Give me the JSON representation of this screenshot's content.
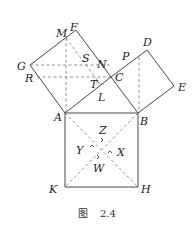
{
  "caption": {
    "figure_char": "图",
    "number": "2.4"
  },
  "points": {
    "A": {
      "label": "A",
      "x": 65,
      "y": 113
    },
    "B": {
      "label": "B",
      "x": 138,
      "y": 113
    },
    "C": {
      "label": "C",
      "x": 111,
      "y": 77
    },
    "D": {
      "label": "D",
      "x": 147,
      "y": 50
    },
    "E": {
      "label": "E",
      "x": 174,
      "y": 86
    },
    "F": {
      "label": "F",
      "x": 76,
      "y": 30
    },
    "G": {
      "label": "G",
      "x": 30,
      "y": 65
    },
    "H": {
      "label": "H",
      "x": 138,
      "y": 187
    },
    "K": {
      "label": "K",
      "x": 65,
      "y": 187
    },
    "M": {
      "label": "M",
      "x": 66,
      "y": 38
    },
    "N": {
      "label": "N",
      "x": 103,
      "y": 71
    },
    "P": {
      "label": "P",
      "x": 124,
      "y": 60
    },
    "R": {
      "label": "R",
      "x": 37,
      "y": 77
    },
    "S": {
      "label": "S",
      "x": 86,
      "y": 55
    },
    "T": {
      "label": "T",
      "x": 97,
      "y": 85
    },
    "L": {
      "label": "L",
      "x": 99,
      "y": 95
    },
    "Z": {
      "label": "Z",
      "x": 102,
      "y": 136
    },
    "Y": {
      "label": "Y",
      "x": 92,
      "y": 146
    },
    "X": {
      "label": "X",
      "x": 111,
      "y": 152
    },
    "W": {
      "label": "W",
      "x": 98,
      "y": 161
    }
  },
  "labels": [
    {
      "text": "M",
      "x": 56,
      "y": 37
    },
    {
      "text": "F",
      "x": 70,
      "y": 31
    },
    {
      "text": "S",
      "x": 82,
      "y": 62
    },
    {
      "text": "G",
      "x": 17,
      "y": 70
    },
    {
      "text": "R",
      "x": 25,
      "y": 82
    },
    {
      "text": "N",
      "x": 97,
      "y": 68
    },
    {
      "text": "P",
      "x": 122,
      "y": 60
    },
    {
      "text": "D",
      "x": 143,
      "y": 46
    },
    {
      "text": "C",
      "x": 115,
      "y": 81
    },
    {
      "text": "T",
      "x": 90,
      "y": 88
    },
    {
      "text": "L",
      "x": 98,
      "y": 101
    },
    {
      "text": "E",
      "x": 178,
      "y": 91
    },
    {
      "text": "A",
      "x": 54,
      "y": 121
    },
    {
      "text": "B",
      "x": 140,
      "y": 125
    },
    {
      "text": "Z",
      "x": 99,
      "y": 134
    },
    {
      "text": "Y",
      "x": 76,
      "y": 154
    },
    {
      "text": "X",
      "x": 117,
      "y": 156
    },
    {
      "text": "W",
      "x": 93,
      "y": 172
    },
    {
      "text": "K",
      "x": 49,
      "y": 193
    },
    {
      "text": "H",
      "x": 141,
      "y": 193
    }
  ]
}
